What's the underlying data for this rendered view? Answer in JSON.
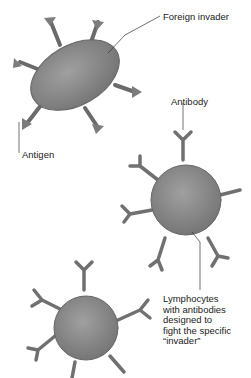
{
  "labels": {
    "foreign_invader": "Foreign invader",
    "antibody": "Antibody",
    "antigen": "Antigen",
    "lymphocyte_lines": [
      "Lymphocytes",
      "with antibodies",
      "designed to",
      "fight the specific",
      "“invader”"
    ]
  },
  "colors": {
    "cell_fill": "#8a8a8a",
    "cell_stroke": "#555555",
    "leader_line": "#333333",
    "background": "#ffffff"
  }
}
